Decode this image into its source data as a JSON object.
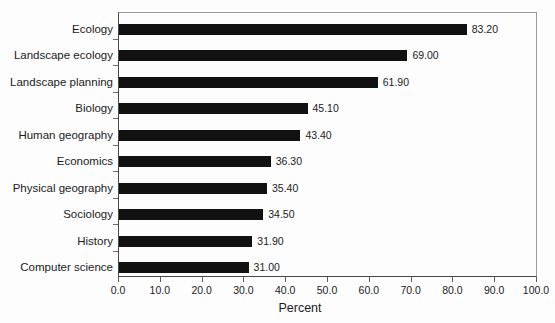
{
  "chart_data": {
    "type": "bar",
    "orientation": "horizontal",
    "title": "",
    "xlabel": "Percent",
    "ylabel": "",
    "xlim": [
      0.0,
      100.0
    ],
    "xtick_labels": [
      "0.0",
      "10.0",
      "20.0",
      "30.0",
      "40.0",
      "50.0",
      "60.0",
      "70.0",
      "80.0",
      "90.0",
      "100.0"
    ],
    "xtick_values": [
      0,
      10,
      20,
      30,
      40,
      50,
      60,
      70,
      80,
      90,
      100
    ],
    "grid": false,
    "legend": false,
    "bar_color": "#111111",
    "categories": [
      "Ecology",
      "Landscape ecology",
      "Landscape planning",
      "Biology",
      "Human geography",
      "Economics",
      "Physical geography",
      "Sociology",
      "History",
      "Computer science"
    ],
    "values": [
      83.2,
      69.0,
      61.9,
      45.1,
      43.4,
      36.3,
      35.4,
      34.5,
      31.9,
      31.0
    ],
    "value_labels": [
      "83.20",
      "69.00",
      "61.90",
      "45.10",
      "43.40",
      "36.30",
      "35.40",
      "34.50",
      "31.90",
      "31.00"
    ]
  }
}
